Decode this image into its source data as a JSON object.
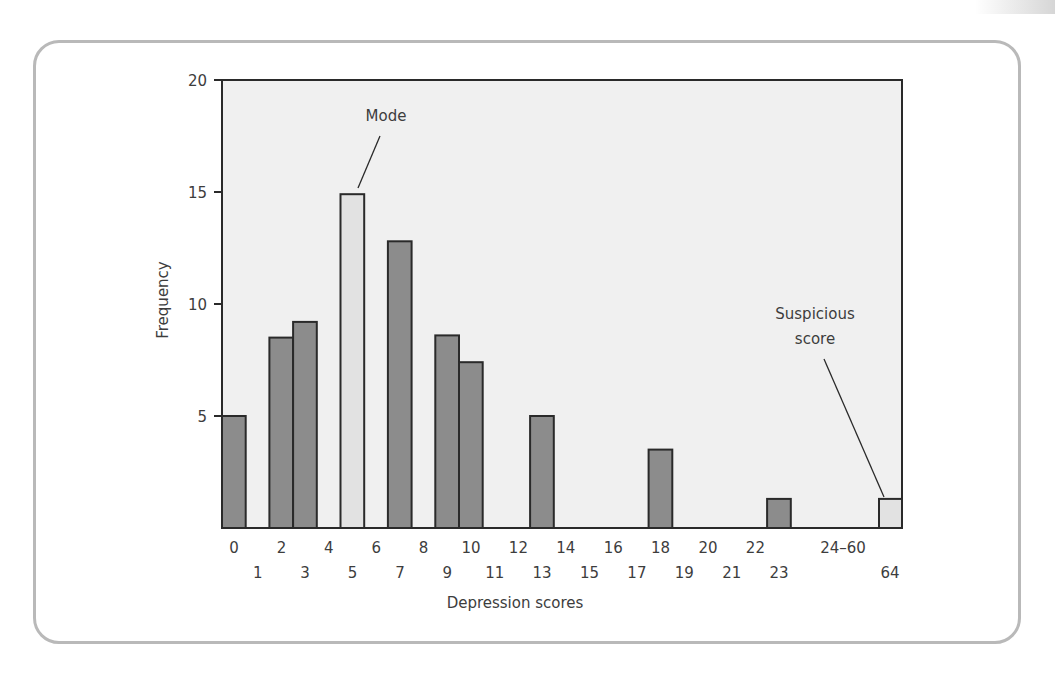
{
  "chart_data": {
    "type": "bar",
    "title": "",
    "xlabel": "Depression scores",
    "ylabel": "Frequency",
    "ylim": [
      0,
      20
    ],
    "yticks": [
      5,
      10,
      15,
      20
    ],
    "grid": false,
    "legend": null,
    "categories": [
      "0",
      "1",
      "2",
      "3",
      "4",
      "5",
      "6",
      "7",
      "8",
      "9",
      "10",
      "11",
      "12",
      "13",
      "14",
      "15",
      "16",
      "17",
      "18",
      "19",
      "20",
      "21",
      "22",
      "23",
      "24–60",
      "64"
    ],
    "values": [
      5,
      0,
      8.5,
      9.2,
      0,
      14.9,
      0,
      12.8,
      0,
      8.6,
      7.4,
      0,
      0,
      5,
      0,
      0,
      0,
      0,
      3.5,
      0,
      0,
      0,
      0,
      1.3,
      0,
      1.3
    ],
    "highlighted": {
      "5": "Mode",
      "64": "Suspicious score"
    },
    "x_tick_labels_row1": [
      "0",
      "2",
      "4",
      "6",
      "8",
      "10",
      "12",
      "14",
      "16",
      "18",
      "20",
      "22",
      "24–60"
    ],
    "x_tick_labels_row2": [
      "1",
      "3",
      "5",
      "7",
      "9",
      "11",
      "13",
      "15",
      "17",
      "19",
      "21",
      "23",
      "64"
    ],
    "annotations": [
      {
        "text": "Mode",
        "target": "5"
      },
      {
        "text": "Suspicious score",
        "target": "64"
      }
    ]
  },
  "colors": {
    "plot_background": "#f0f0f0",
    "bar_fill": "#8c8c8c",
    "highlight_fill": "#e2e2e2",
    "bar_stroke": "#2a2a2a",
    "card_border": "#b9b9b9",
    "text": "#3d3d3d"
  },
  "labels": {
    "ylabel": "Frequency",
    "xlabel": "Depression scores",
    "mode": "Mode",
    "suspicious_line1": "Suspicious",
    "suspicious_line2": "score",
    "y20": "20",
    "y15": "15",
    "y10": "10",
    "y5": "5"
  }
}
